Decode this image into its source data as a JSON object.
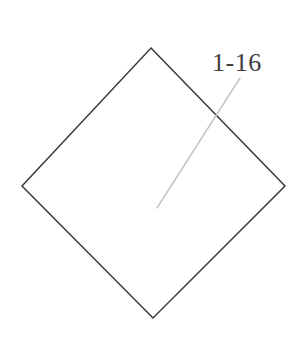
{
  "figure": {
    "background_color": "#ffffff",
    "width": 305,
    "height": 354,
    "callout": {
      "label": "1-16",
      "text_color": "#3d3d3d",
      "font_size_px": 26
    },
    "leader_line": {
      "name": "leader-line",
      "color": "#c3c3c3",
      "stroke_width": 1.4,
      "start_x": 240,
      "start_y": 78,
      "end_x": 157,
      "end_y": 208
    },
    "shape": {
      "name": "rotated-square",
      "type": "diamond",
      "stroke_color": "#3a3a3a",
      "stroke_width": 1.5,
      "fill_color": "#ffffff",
      "vertices": {
        "top_x": 151,
        "top_y": 48,
        "right_x": 285,
        "right_y": 186,
        "bottom_x": 153,
        "bottom_y": 318,
        "left_x": 22,
        "left_y": 186
      },
      "points": "151,48 285,186 153,318 22,186"
    }
  }
}
